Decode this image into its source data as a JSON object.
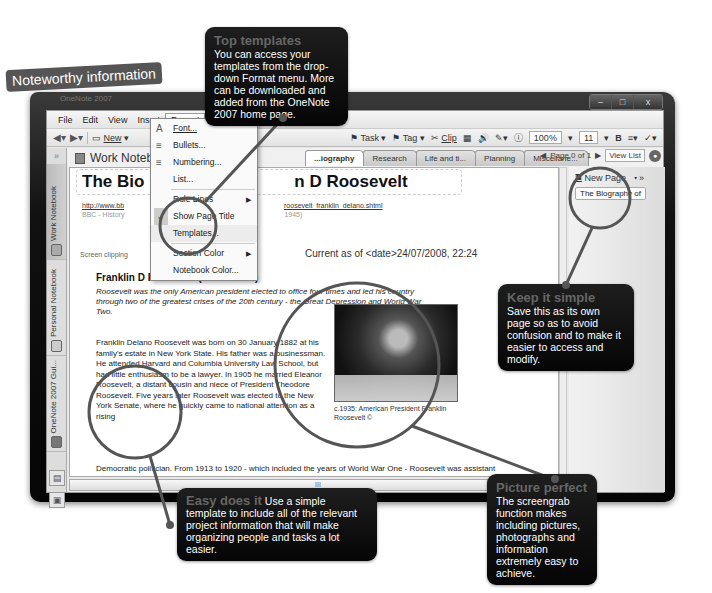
{
  "banner": "Noteworthy information",
  "window": {
    "title": "OneNote 2007",
    "controls": [
      "minimize",
      "maximize",
      "close"
    ]
  },
  "menubar": [
    "File",
    "Edit",
    "View",
    "Insert",
    "Format",
    "Share",
    "Tools",
    "Table",
    "Window",
    "Help"
  ],
  "menubar_visible": [
    "File",
    "Edit",
    "View",
    "Insert",
    "Format",
    "Sha"
  ],
  "toolbar": {
    "new_label": "New",
    "task_label": "Task",
    "tag_label": "Tag",
    "clip_label": "Clip",
    "zoom": "100%",
    "font_size": "11",
    "bold": "B"
  },
  "navbar": {
    "collapse": "»",
    "notebooks": [
      "Work Notebook",
      "Personal Notebook",
      "OneNote 2007 Gui..."
    ]
  },
  "notebook": {
    "title": "Work Noteb...",
    "tabs": [
      "...iography",
      "Research",
      "Life and ti...",
      "Planning",
      "Miscellane..."
    ],
    "active_tab": "...iography",
    "page_nav": "Page 0 of 1",
    "view_list": "View List"
  },
  "format_menu": {
    "items": [
      {
        "label": "Font...",
        "icon": "A"
      },
      {
        "label": "Bullets...",
        "icon": "bullets-icon"
      },
      {
        "label": "Numbering...",
        "icon": "numbering-icon"
      },
      {
        "label": "List...",
        "icon": ""
      },
      {
        "label": "Rule Lines",
        "submenu": true
      },
      {
        "label": "Show Page Title",
        "checked": true
      },
      {
        "label": "Templates...",
        "highlighted": true
      },
      {
        "label": "Section Color",
        "submenu": true
      },
      {
        "label": "Notebook Color..."
      }
    ]
  },
  "page": {
    "title_visible_left": "The Bio",
    "title_visible_right": "n D Roosevelt",
    "url_left": "http://www.bb",
    "url_right": "roosevelt_franklin_delano.shtml",
    "source_left": "BBC - History",
    "source_right": "1945)",
    "clip_label": "Screen clipping",
    "current_as": "Current as of <date>24/07/2008, 22:24",
    "heading": "Franklin D Roosevelt (1882 - 1945)",
    "intro": "Roosevelt was the only American president elected to office four times and led his country through two of the greatest crises of the 20th century - the Great Depression and World War Two.",
    "body1": "Franklin Delano Roosevelt was born on 30 January 1882 at his family's estate in New York State. His father was a businessman. He attended Harvard and Columbia University Law School, but had little enthusiasm to be a lawyer. In 1905 he married Eleanor Roosevelt, a distant cousin and niece of President Theodore Roosevelt. Five years later Roosevelt was elected to the New York Senate, where he quickly came to national attention as a rising",
    "body2": "Democratic politician. From 1913 to 1920 - which included the years of World War One - Roosevelt was assistant secretary of the Navy, where he achieved a reputation as a capable young administrator.",
    "photo_caption": "c.1935: American President Franklin Roosevelt ©"
  },
  "pagelist": {
    "new_page": "New Page",
    "pages": [
      "The Biography of"
    ]
  },
  "hscroll_grip": "III",
  "callouts": {
    "top_templates": {
      "heading": "Top templates",
      "text": "You can access your templates from the drop-down Format menu. More can be downloaded and added from the OneNote 2007 home page."
    },
    "keep_simple": {
      "heading": "Keep it simple",
      "text": "Save this as its own page so as to avoid confusion and to make it easier to access and modify."
    },
    "easy_does_it": {
      "heading": "Easy does it",
      "text": "Use a simple template to include all of the relevant project information that will make organizing people and tasks a lot easier."
    },
    "picture_perfect": {
      "heading": "Picture perfect",
      "text": "The screengrab function makes including pictures, photographs and information extremely easy to achieve."
    }
  },
  "colors": {
    "callout_bg": "#0d0d0d",
    "callout_heading": "#666666",
    "banner_bg": "#555555",
    "magnifier_ring": "#555555"
  }
}
